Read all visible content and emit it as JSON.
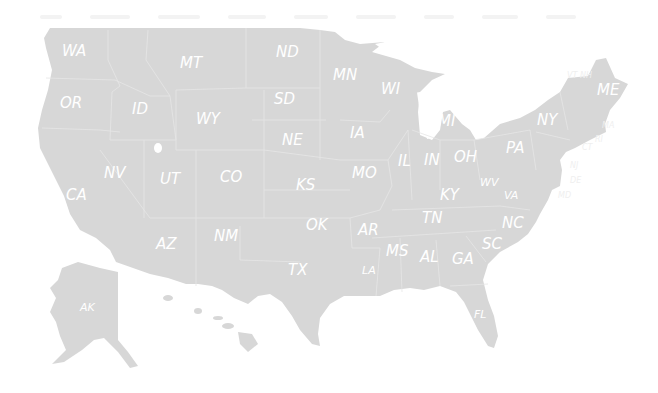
{
  "map": {
    "title": "United States Map",
    "fill_color": "#d7d7d7",
    "label_color": "#ffffff",
    "background": "#ffffff",
    "states": [
      {
        "abbr": "WA",
        "x": 62,
        "y": 56
      },
      {
        "abbr": "OR",
        "x": 60,
        "y": 108
      },
      {
        "abbr": "ID",
        "x": 132,
        "y": 114
      },
      {
        "abbr": "MT",
        "x": 180,
        "y": 68
      },
      {
        "abbr": "WY",
        "x": 196,
        "y": 124
      },
      {
        "abbr": "ND",
        "x": 276,
        "y": 57
      },
      {
        "abbr": "SD",
        "x": 274,
        "y": 104
      },
      {
        "abbr": "NE",
        "x": 282,
        "y": 145
      },
      {
        "abbr": "MN",
        "x": 333,
        "y": 80
      },
      {
        "abbr": "WI",
        "x": 381,
        "y": 94
      },
      {
        "abbr": "IA",
        "x": 350,
        "y": 138
      },
      {
        "abbr": "MI",
        "x": 438,
        "y": 126
      },
      {
        "abbr": "NY",
        "x": 537,
        "y": 125
      },
      {
        "abbr": "ME",
        "x": 597,
        "y": 95
      },
      {
        "abbr": "VT",
        "x": 567,
        "y": 78
      },
      {
        "abbr": "NH",
        "x": 580,
        "y": 78
      },
      {
        "abbr": "MA",
        "x": 602,
        "y": 128
      },
      {
        "abbr": "CT",
        "x": 582,
        "y": 150
      },
      {
        "abbr": "RI",
        "x": 595,
        "y": 142
      },
      {
        "abbr": "NJ",
        "x": 570,
        "y": 168
      },
      {
        "abbr": "DE",
        "x": 570,
        "y": 183
      },
      {
        "abbr": "MD",
        "x": 558,
        "y": 198
      },
      {
        "abbr": "PA",
        "x": 506,
        "y": 153
      },
      {
        "abbr": "OH",
        "x": 454,
        "y": 162
      },
      {
        "abbr": "IN",
        "x": 424,
        "y": 165
      },
      {
        "abbr": "IL",
        "x": 398,
        "y": 166
      },
      {
        "abbr": "MO",
        "x": 352,
        "y": 178
      },
      {
        "abbr": "NV",
        "x": 104,
        "y": 178
      },
      {
        "abbr": "UT",
        "x": 160,
        "y": 184
      },
      {
        "abbr": "CO",
        "x": 220,
        "y": 182
      },
      {
        "abbr": "KS",
        "x": 296,
        "y": 190
      },
      {
        "abbr": "CA",
        "x": 66,
        "y": 200
      },
      {
        "abbr": "KY",
        "x": 440,
        "y": 200
      },
      {
        "abbr": "WV",
        "x": 480,
        "y": 186
      },
      {
        "abbr": "VA",
        "x": 504,
        "y": 199
      },
      {
        "abbr": "TN",
        "x": 422,
        "y": 223
      },
      {
        "abbr": "NC",
        "x": 502,
        "y": 228
      },
      {
        "abbr": "OK",
        "x": 306,
        "y": 230
      },
      {
        "abbr": "AR",
        "x": 358,
        "y": 235
      },
      {
        "abbr": "SC",
        "x": 482,
        "y": 249
      },
      {
        "abbr": "MS",
        "x": 386,
        "y": 256
      },
      {
        "abbr": "AL",
        "x": 420,
        "y": 262
      },
      {
        "abbr": "GA",
        "x": 452,
        "y": 264
      },
      {
        "abbr": "AZ",
        "x": 156,
        "y": 249
      },
      {
        "abbr": "NM",
        "x": 214,
        "y": 241
      },
      {
        "abbr": "TX",
        "x": 288,
        "y": 275
      },
      {
        "abbr": "LA",
        "x": 362,
        "y": 274
      },
      {
        "abbr": "FL",
        "x": 474,
        "y": 318
      },
      {
        "abbr": "AK",
        "x": 80,
        "y": 311
      },
      {
        "abbr": "HI",
        "x": 212,
        "y": 352
      }
    ]
  }
}
